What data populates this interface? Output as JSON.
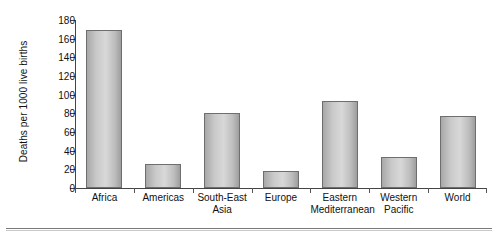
{
  "chart_data": {
    "type": "bar",
    "title": "",
    "xlabel": "",
    "ylabel": "Deaths per 1000 live births",
    "ylim": [
      0,
      180
    ],
    "yticks": [
      0,
      20,
      40,
      60,
      80,
      100,
      120,
      140,
      160,
      180
    ],
    "grid": false,
    "legend": null,
    "categories": [
      "Africa",
      "Americas",
      "South-East Asia",
      "Europe",
      "Eastern Mediterranean",
      "Western Pacific",
      "World"
    ],
    "category_lines": [
      [
        "Africa"
      ],
      [
        "Americas"
      ],
      [
        "South-East",
        "Asia"
      ],
      [
        "Europe"
      ],
      [
        "Eastern",
        "Mediterranean"
      ],
      [
        "Western",
        "Pacific"
      ],
      [
        "World"
      ]
    ],
    "values": [
      169,
      26,
      80,
      18,
      93,
      33,
      77
    ],
    "bar_color": "#c6c6c6",
    "bar_edge_color": "#6e6e6e",
    "axis_color": "#444444"
  }
}
